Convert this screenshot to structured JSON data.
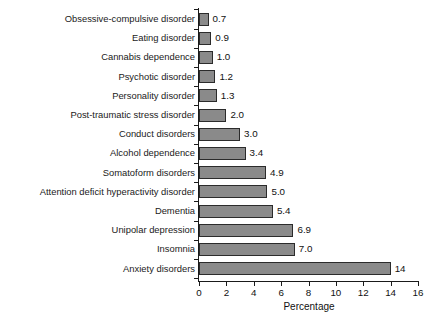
{
  "chart_data": {
    "type": "bar",
    "orientation": "horizontal",
    "title": "",
    "subtitle": "",
    "xlabel": "Percentage",
    "ylabel": "",
    "xlim": [
      0,
      16
    ],
    "xticks": [
      0,
      2,
      4,
      6,
      8,
      10,
      12,
      14,
      16
    ],
    "xtick_labels": [
      "0",
      "2",
      "4",
      "6",
      "8",
      "10",
      "12",
      "14",
      "16"
    ],
    "grid": false,
    "legend": null,
    "categories": [
      "Obsessive-compulsive disorder",
      "Eating disorder",
      "Cannabis dependence",
      "Psychotic disorder",
      "Personality disorder",
      "Post-traumatic stress disorder",
      "Conduct disorders",
      "Alcohol dependence",
      "Somatoform disorders",
      "Attention deficit hyperactivity disorder",
      "Dementia",
      "Unipolar depression",
      "Insomnia",
      "Anxiety disorders"
    ],
    "values": [
      0.7,
      0.9,
      1.0,
      1.2,
      1.3,
      2.0,
      3.0,
      3.4,
      4.9,
      5.0,
      5.4,
      6.9,
      7.0,
      14
    ],
    "value_labels": [
      "0.7",
      "0.9",
      "1.0",
      "1.2",
      "1.3",
      "2.0",
      "3.0",
      "3.4",
      "4.9",
      "5.0",
      "5.4",
      "6.9",
      "7.0",
      "14"
    ],
    "bar_color": "#8a8a8a",
    "bar_edge_color": "#2b2b2b",
    "axis_color": "#1a1a1a",
    "background_color": "#ffffff"
  }
}
